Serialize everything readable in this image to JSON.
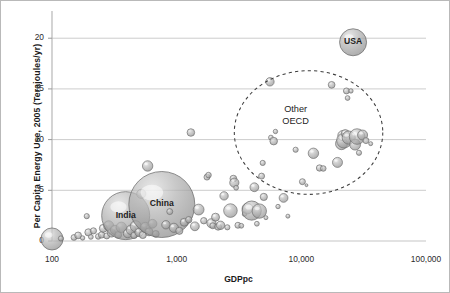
{
  "chart_data": {
    "type": "scatter",
    "title": "",
    "subtitle": "",
    "xlabel": "GDPpc",
    "ylabel": "Per Capita Energy Use, 2005  (Terajoules/yr)",
    "x_scale": "log",
    "y_scale": "linear",
    "xlim": [
      100,
      100000
    ],
    "ylim": [
      0,
      21.5
    ],
    "xticks": [
      "100",
      "1,000",
      "10,000",
      "100,000"
    ],
    "xtick_values": [
      100,
      1000,
      10000,
      100000
    ],
    "yticks": [
      "0",
      "5",
      "10",
      "15",
      "20"
    ],
    "ytick_values": [
      0,
      5,
      10,
      15,
      20
    ],
    "grid": "horizontal",
    "legend": "none",
    "bubble_encoding": "bubble area represents population",
    "annotations": [
      {
        "name": "usa-label",
        "text": "USA",
        "x": 26000,
        "y": 19.6
      },
      {
        "name": "china-label",
        "text": "China",
        "x": 760,
        "y": 3.6
      },
      {
        "name": "india-label",
        "text": "India",
        "x": 390,
        "y": 2.5
      },
      {
        "name": "other-oecd-label",
        "text": "Other\nOECD",
        "x": 9000,
        "y": 12.3
      }
    ],
    "ellipse_annotation": {
      "name": "other-oecd-ellipse",
      "style": "dashed",
      "center_x": 7500,
      "center_y": 10.4,
      "label": "Other OECD"
    },
    "points": [
      {
        "x": 100,
        "y": 0.2,
        "r": 11
      },
      {
        "x": 118,
        "y": 0.25,
        "r": 2.6
      },
      {
        "x": 150,
        "y": 0.35,
        "r": 2.9
      },
      {
        "x": 162,
        "y": 0.55,
        "r": 3.4
      },
      {
        "x": 176,
        "y": 0.3,
        "r": 2.2
      },
      {
        "x": 190,
        "y": 2.45,
        "r": 2.6
      },
      {
        "x": 196,
        "y": 0.85,
        "r": 3.6
      },
      {
        "x": 205,
        "y": 0.4,
        "r": 2.4
      },
      {
        "x": 215,
        "y": 1.0,
        "r": 3.1
      },
      {
        "x": 235,
        "y": 0.45,
        "r": 2.8
      },
      {
        "x": 250,
        "y": 0.6,
        "r": 3.2
      },
      {
        "x": 258,
        "y": 1.25,
        "r": 4.0
      },
      {
        "x": 275,
        "y": 0.5,
        "r": 3.0
      },
      {
        "x": 285,
        "y": 1.5,
        "r": 5.0
      },
      {
        "x": 300,
        "y": 0.8,
        "r": 4.2
      },
      {
        "x": 320,
        "y": 1.1,
        "r": 4.6
      },
      {
        "x": 340,
        "y": 0.6,
        "r": 3.4
      },
      {
        "x": 360,
        "y": 1.35,
        "r": 5.2
      },
      {
        "x": 390,
        "y": 2.5,
        "r": 24.0
      },
      {
        "x": 405,
        "y": 0.75,
        "r": 4.4
      },
      {
        "x": 430,
        "y": 1.1,
        "r": 4.8
      },
      {
        "x": 455,
        "y": 0.55,
        "r": 3.2
      },
      {
        "x": 470,
        "y": 1.45,
        "r": 5.6
      },
      {
        "x": 500,
        "y": 0.85,
        "r": 4.2
      },
      {
        "x": 520,
        "y": 4.65,
        "r": 4.6
      },
      {
        "x": 535,
        "y": 0.6,
        "r": 3.6
      },
      {
        "x": 560,
        "y": 1.35,
        "r": 5.0
      },
      {
        "x": 585,
        "y": 7.4,
        "r": 5.2
      },
      {
        "x": 600,
        "y": 0.9,
        "r": 4.0
      },
      {
        "x": 640,
        "y": 1.7,
        "r": 4.4
      },
      {
        "x": 680,
        "y": 0.7,
        "r": 3.4
      },
      {
        "x": 760,
        "y": 3.6,
        "r": 33.0
      },
      {
        "x": 820,
        "y": 1.6,
        "r": 4.2
      },
      {
        "x": 880,
        "y": 2.9,
        "r": 3.0
      },
      {
        "x": 950,
        "y": 1.3,
        "r": 4.6
      },
      {
        "x": 1050,
        "y": 1.0,
        "r": 3.6
      },
      {
        "x": 1150,
        "y": 1.85,
        "r": 4.0
      },
      {
        "x": 1250,
        "y": 2.1,
        "r": 3.2
      },
      {
        "x": 1300,
        "y": 10.7,
        "r": 3.8
      },
      {
        "x": 1400,
        "y": 1.45,
        "r": 4.4
      },
      {
        "x": 1500,
        "y": 3.1,
        "r": 5.4
      },
      {
        "x": 1650,
        "y": 2.0,
        "r": 3.2
      },
      {
        "x": 1750,
        "y": 6.3,
        "r": 3.0
      },
      {
        "x": 1800,
        "y": 6.5,
        "r": 2.8
      },
      {
        "x": 1900,
        "y": 1.75,
        "r": 4.6
      },
      {
        "x": 1950,
        "y": 1.5,
        "r": 3.0
      },
      {
        "x": 2050,
        "y": 2.35,
        "r": 4.0
      },
      {
        "x": 2150,
        "y": 1.4,
        "r": 3.4
      },
      {
        "x": 2250,
        "y": 1.55,
        "r": 4.2
      },
      {
        "x": 2400,
        "y": 4.45,
        "r": 4.2
      },
      {
        "x": 2550,
        "y": 1.35,
        "r": 2.6
      },
      {
        "x": 2700,
        "y": 3.0,
        "r": 6.8
      },
      {
        "x": 2850,
        "y": 6.15,
        "r": 3.4
      },
      {
        "x": 2900,
        "y": 5.75,
        "r": 4.6
      },
      {
        "x": 3000,
        "y": 5.25,
        "r": 2.4
      },
      {
        "x": 3100,
        "y": 1.55,
        "r": 3.0
      },
      {
        "x": 3300,
        "y": 1.5,
        "r": 2.4
      },
      {
        "x": 3500,
        "y": 2.65,
        "r": 2.2
      },
      {
        "x": 3700,
        "y": 3.2,
        "r": 5.4
      },
      {
        "x": 4000,
        "y": 3.0,
        "r": 9.6
      },
      {
        "x": 4200,
        "y": 5.3,
        "r": 4.4
      },
      {
        "x": 4400,
        "y": 1.7,
        "r": 2.4
      },
      {
        "x": 4600,
        "y": 2.95,
        "r": 7.2
      },
      {
        "x": 4800,
        "y": 6.4,
        "r": 3.0
      },
      {
        "x": 4900,
        "y": 7.7,
        "r": 2.6
      },
      {
        "x": 5000,
        "y": 4.35,
        "r": 3.6
      },
      {
        "x": 5200,
        "y": 2.3,
        "r": 2.0
      },
      {
        "x": 5600,
        "y": 15.7,
        "r": 4.2
      },
      {
        "x": 5700,
        "y": 10.2,
        "r": 2.4
      },
      {
        "x": 6000,
        "y": 9.85,
        "r": 3.8
      },
      {
        "x": 6200,
        "y": 10.8,
        "r": 2.2
      },
      {
        "x": 6500,
        "y": 3.4,
        "r": 2.2
      },
      {
        "x": 7200,
        "y": 4.25,
        "r": 4.4
      },
      {
        "x": 7800,
        "y": 2.45,
        "r": 2.0
      },
      {
        "x": 9000,
        "y": 9.0,
        "r": 2.6
      },
      {
        "x": 10200,
        "y": 5.85,
        "r": 3.0
      },
      {
        "x": 11000,
        "y": 5.5,
        "r": 1.4
      },
      {
        "x": 12500,
        "y": 8.65,
        "r": 5.2
      },
      {
        "x": 14000,
        "y": 7.2,
        "r": 3.2
      },
      {
        "x": 15000,
        "y": 7.15,
        "r": 2.8
      },
      {
        "x": 17500,
        "y": 15.4,
        "r": 3.4
      },
      {
        "x": 19500,
        "y": 7.75,
        "r": 5.0
      },
      {
        "x": 21000,
        "y": 9.6,
        "r": 6.0
      },
      {
        "x": 21500,
        "y": 10.4,
        "r": 5.0
      },
      {
        "x": 22000,
        "y": 9.9,
        "r": 7.4
      },
      {
        "x": 22500,
        "y": 10.6,
        "r": 4.0
      },
      {
        "x": 23000,
        "y": 14.8,
        "r": 3.0
      },
      {
        "x": 23500,
        "y": 14.1,
        "r": 2.4
      },
      {
        "x": 24000,
        "y": 10.2,
        "r": 6.6
      },
      {
        "x": 25000,
        "y": 14.8,
        "r": 2.2
      },
      {
        "x": 26000,
        "y": 19.6,
        "r": 13.5
      },
      {
        "x": 27000,
        "y": 9.5,
        "r": 5.4
      },
      {
        "x": 28000,
        "y": 10.3,
        "r": 7.8
      },
      {
        "x": 29000,
        "y": 8.7,
        "r": 2.6
      },
      {
        "x": 31000,
        "y": 10.45,
        "r": 5.0
      },
      {
        "x": 33000,
        "y": 9.9,
        "r": 3.0
      },
      {
        "x": 36000,
        "y": 9.6,
        "r": 2.0
      }
    ]
  }
}
